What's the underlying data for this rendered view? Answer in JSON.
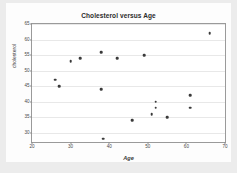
{
  "chart_data": {
    "type": "scatter",
    "title": "Cholesterol versus Age",
    "xlabel": "Age",
    "ylabel": "cholesterol",
    "xlim": [
      20,
      70
    ],
    "ylim": [
      27,
      65
    ],
    "xticks": [
      20,
      30,
      40,
      50,
      60,
      70
    ],
    "yticks": [
      30,
      35,
      40,
      45,
      50,
      55,
      60,
      65
    ],
    "grid": true,
    "grid_axis": "y",
    "legend": null,
    "marker": "filled-circle",
    "marker_color": "#3a3a3a",
    "points": [
      {
        "x": 26,
        "y": 47
      },
      {
        "x": 27,
        "y": 45
      },
      {
        "x": 30,
        "y": 53
      },
      {
        "x": 32.5,
        "y": 54
      },
      {
        "x": 38,
        "y": 56
      },
      {
        "x": 38,
        "y": 44
      },
      {
        "x": 38.5,
        "y": 28
      },
      {
        "x": 42,
        "y": 54
      },
      {
        "x": 46,
        "y": 34
      },
      {
        "x": 49,
        "y": 55
      },
      {
        "x": 51,
        "y": 36
      },
      {
        "x": 52,
        "y": 40
      },
      {
        "x": 52,
        "y": 38
      },
      {
        "x": 55,
        "y": 35
      },
      {
        "x": 61,
        "y": 42
      },
      {
        "x": 61,
        "y": 38
      },
      {
        "x": 66,
        "y": 62
      }
    ]
  }
}
